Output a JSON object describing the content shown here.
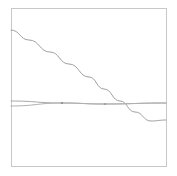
{
  "figure": {
    "background_color": "#ffffff",
    "width": 177,
    "height": 176
  },
  "plot_frame": {
    "left": 11,
    "top": 8,
    "right": 166,
    "bottom": 166,
    "border_color": "#c8c8c8"
  },
  "chart_data": {
    "type": "line",
    "title": "",
    "subtitle": "",
    "xlabel": "",
    "ylabel": "",
    "xlim": [
      0,
      1
    ],
    "ylim": [
      0,
      1
    ],
    "grid": false,
    "legend": false,
    "legend_position": "none",
    "annotations": [],
    "xtick_labels": [],
    "ytick_labels": [],
    "series": [
      {
        "name": "descending-curve",
        "color": "#a0a0a0",
        "linewidth": 1.0,
        "style": "solid",
        "x": [
          0.0,
          0.12,
          0.25,
          0.37,
          0.5,
          0.6,
          0.7,
          0.8,
          0.9,
          1.0
        ],
        "y": [
          0.861,
          0.797,
          0.722,
          0.646,
          0.563,
          0.487,
          0.411,
          0.342,
          0.285,
          0.291
        ],
        "points_px": [
          [
            11,
            30
          ],
          [
            29,
            40
          ],
          [
            50,
            52
          ],
          [
            69,
            64
          ],
          [
            89,
            77
          ],
          [
            104,
            89
          ],
          [
            120,
            101
          ],
          [
            135,
            112
          ],
          [
            151,
            121
          ],
          [
            166,
            120
          ]
        ]
      },
      {
        "name": "upper-flat-line",
        "color": "#a8a8a8",
        "linewidth": 1.0,
        "style": "solid",
        "x": [
          0.0,
          0.33,
          0.6,
          1.0
        ],
        "y": [
          0.424,
          0.411,
          0.405,
          0.399
        ],
        "points_px": [
          [
            11,
            101
          ],
          [
            62,
            103
          ],
          [
            104,
            104
          ],
          [
            166,
            103
          ]
        ]
      },
      {
        "name": "lower-flat-line",
        "color": "#b0b0b0",
        "linewidth": 1.0,
        "style": "solid",
        "x": [
          0.0,
          0.33,
          0.6,
          1.0
        ],
        "y": [
          0.392,
          0.406,
          0.404,
          0.399
        ],
        "points_px": [
          [
            11,
            106
          ],
          [
            62,
            103
          ],
          [
            104,
            104
          ],
          [
            166,
            103
          ]
        ]
      }
    ],
    "markers": [
      {
        "name": "convergence-marker",
        "x_px": 62,
        "y_px": 103,
        "color": "#8c8c8c",
        "radius": 1.1
      },
      {
        "name": "intersection-marker",
        "x_px": 105,
        "y_px": 104,
        "color": "#9a9a9a",
        "radius": 1.0
      }
    ],
    "corner_label": ""
  }
}
